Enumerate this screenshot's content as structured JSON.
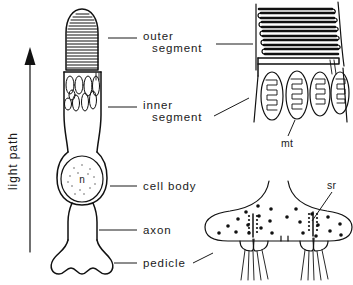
{
  "figure": {
    "background_color": "#ffffff",
    "line_color": "#111111",
    "text_color": "#1a1a1a"
  },
  "axis_annotation": {
    "label": "light path",
    "direction": "upward",
    "arrow_icon": "up-arrow-icon"
  },
  "labels": {
    "outer_segment_line1": "outer",
    "outer_segment_line2": "segment",
    "inner_segment_line1": "inner",
    "inner_segment_line2": "segment",
    "cell_body": "cell body",
    "axon": "axon",
    "pedicle": "pedicle",
    "nucleus": "n",
    "mitochondria": "mt",
    "synaptic_ribbon": "sr"
  },
  "main_cell": {
    "name": "photoreceptor-cell",
    "parts": [
      "outer segment",
      "inner segment",
      "cell body",
      "axon",
      "pedicle"
    ],
    "outer_segment": {
      "shape": "bullet-dome",
      "feature": "stacked membranous discs",
      "disc_count": 22
    },
    "inner_segment": {
      "feature": "ellipsoid mitochondria",
      "mitochondria_count": 9
    },
    "cell_body": {
      "feature": "nucleus with stippling",
      "nucleus_label": "n"
    },
    "pedicle": {
      "shape": "flared synaptic foot",
      "lobe_count": 2
    }
  },
  "inset_outer_segment": {
    "name": "outer-segment-detail",
    "feature": "folded serpentine disc membranes",
    "fold_count": 11,
    "callout_from": "outer segment"
  },
  "inset_inner_segment": {
    "name": "inner-segment-detail",
    "feature": "mitochondria with cristae",
    "mitochondria_count": 4,
    "labeled_part": "mt",
    "callout_from": "inner segment"
  },
  "inset_pedicle": {
    "name": "pedicle-detail",
    "feature": "synaptic terminals with vesicles and synaptic ribbons",
    "terminal_count": 2,
    "labeled_part": "sr",
    "callout_from": "pedicle"
  }
}
